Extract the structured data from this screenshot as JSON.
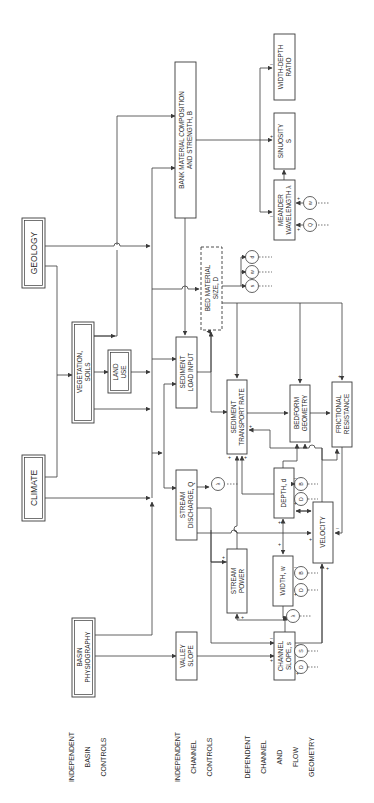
{
  "diagram": {
    "orientation": "rotated 90 degrees counter-clockwise",
    "row_labels": {
      "basin": [
        "INDEPENDENT",
        "BASIN",
        "CONTROLS"
      ],
      "channel": [
        "INDEPENDENT",
        "CHANNEL",
        "CONTROLS"
      ],
      "dependent": [
        "DEPENDENT",
        "CHANNEL",
        "AND",
        "FLOW",
        "GEOMETRY"
      ]
    },
    "nodes": {
      "climate": {
        "label": "CLIMATE",
        "style": "double"
      },
      "geology": {
        "label": "GEOLOGY",
        "style": "double"
      },
      "basin_physiography": {
        "lines": [
          "BASIN",
          "PHYSIOGRAPHY"
        ],
        "style": "double"
      },
      "vegetation_soils": {
        "lines": [
          "VEGETATION,",
          "SOILS"
        ],
        "style": "double"
      },
      "land_use": {
        "lines": [
          "LAND",
          "USE"
        ],
        "style": "double"
      },
      "valley_slope": {
        "lines": [
          "VALLEY",
          "SLOPE"
        ]
      },
      "stream_discharge": {
        "lines": [
          "STREAM",
          "DISCHARGE, Q"
        ]
      },
      "sediment_load_input": {
        "lines": [
          "SEDIMENT",
          "LOAD INPUT"
        ]
      },
      "bed_material_size": {
        "lines": [
          "BED MATERIAL",
          "SIZE, D"
        ],
        "style": "dashed"
      },
      "bank_material": {
        "lines": [
          "BANK MATERIAL COMPOSITION",
          "AND STRENGTH, B"
        ]
      },
      "stream_power": {
        "lines": [
          "STREAM",
          "POWER"
        ]
      },
      "sediment_transport_rate": {
        "lines": [
          "SEDIMENT",
          "TRANSPORT RATE"
        ]
      },
      "bedform_geometry": {
        "lines": [
          "BEDFORM",
          "GEOMETRY"
        ]
      },
      "frictional_resistance": {
        "lines": [
          "FRICTIONAL",
          "RESISTANCE"
        ]
      },
      "depth": {
        "label": "DEPTH, d"
      },
      "velocity": {
        "label": "VELOCITY"
      },
      "width": {
        "label": "WIDTH, w"
      },
      "channel_slope": {
        "lines": [
          "CHANNEL",
          "SLOPE, s"
        ]
      },
      "meander_wavelength": {
        "lines": [
          "MEANDER",
          "WAVELENGTH λ"
        ]
      },
      "sinuosity": {
        "lines": [
          "SINUOSITY",
          "S"
        ]
      },
      "width_depth_ratio": {
        "lines": [
          "WIDTH-DEPTH",
          "RATIO"
        ]
      }
    },
    "circles": {
      "lambda_q": "λ",
      "bed_d": "d",
      "bed_w": "w",
      "bed_s": "s",
      "mw_w": "w",
      "mw_q": "Q",
      "depth_b": "B",
      "depth_d": "D",
      "width_b": "B",
      "width_d": "D",
      "width_lambda": "λ",
      "slope_s": "S",
      "slope_d": "D"
    },
    "signs": {
      "plus": "+",
      "minus": "–"
    }
  }
}
